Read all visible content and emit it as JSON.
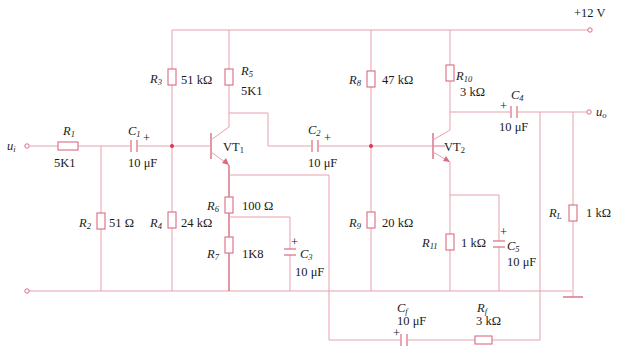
{
  "diagram": {
    "type": "two-stage transistor amplifier with feedback",
    "supply": "+12 V",
    "input_label": "u",
    "input_sub": "i",
    "output_label": "u",
    "output_sub": "o",
    "transistors": [
      {
        "name": "VT",
        "sub": "1"
      },
      {
        "name": "VT",
        "sub": "2"
      }
    ],
    "resistors": [
      {
        "name": "R",
        "sub": "1",
        "value": "5K1"
      },
      {
        "name": "R",
        "sub": "2",
        "value": "51 Ω"
      },
      {
        "name": "R",
        "sub": "3",
        "value": "51 kΩ"
      },
      {
        "name": "R",
        "sub": "4",
        "value": "24 kΩ"
      },
      {
        "name": "R",
        "sub": "5",
        "value": "5K1"
      },
      {
        "name": "R",
        "sub": "6",
        "value": "100 Ω"
      },
      {
        "name": "R",
        "sub": "7",
        "value": "1K8"
      },
      {
        "name": "R",
        "sub": "8",
        "value": "47 kΩ"
      },
      {
        "name": "R",
        "sub": "9",
        "value": "20 kΩ"
      },
      {
        "name": "R",
        "sub": "10",
        "value": "3 kΩ"
      },
      {
        "name": "R",
        "sub": "11",
        "value": "1 kΩ"
      },
      {
        "name": "R",
        "sub": "L",
        "value": "1 kΩ"
      },
      {
        "name": "R",
        "sub": "f",
        "value": "3 kΩ"
      }
    ],
    "capacitors": [
      {
        "name": "C",
        "sub": "1",
        "value": "10 μF"
      },
      {
        "name": "C",
        "sub": "2",
        "value": "10 μF"
      },
      {
        "name": "C",
        "sub": "3",
        "value": "10 μF"
      },
      {
        "name": "C",
        "sub": "4",
        "value": "10 μF"
      },
      {
        "name": "C",
        "sub": "5",
        "value": "10 μF"
      },
      {
        "name": "C",
        "sub": "f",
        "value": "10 μF"
      }
    ],
    "plus_sign": "+"
  }
}
